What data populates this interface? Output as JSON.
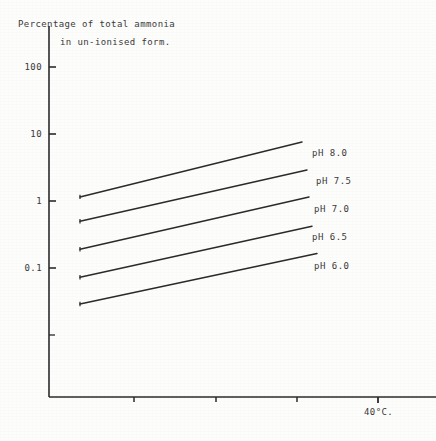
{
  "chart_data": {
    "type": "line",
    "title": "Percentage of total ammonia in un-ionised form.",
    "title_lines": [
      "Percentage of total ammonia",
      "in un-ionised form."
    ],
    "xlabel": "40°C.",
    "ylabel": "",
    "yscale": "log",
    "ytick_labels": [
      "100",
      "10",
      "1",
      "0.1"
    ],
    "ytick_values": [
      100,
      10,
      1,
      0.1
    ],
    "ylim": [
      0.01,
      300
    ],
    "xlim": [
      0,
      45
    ],
    "xtick_labels": [
      "",
      "",
      "",
      "40°C."
    ],
    "xtick_values": [
      10,
      20,
      30,
      40
    ],
    "grid": false,
    "legend_position": "right-inline",
    "series": [
      {
        "name": "pH 8.0",
        "label": "pH 8.0",
        "color": "#2b2b2b",
        "x": [
          10,
          40
        ],
        "values": [
          1.15,
          7.6
        ]
      },
      {
        "name": "pH 7.5",
        "label": "pH 7.5",
        "color": "#2b2b2b",
        "x": [
          10,
          40
        ],
        "values": [
          0.5,
          2.9
        ]
      },
      {
        "name": "pH 7.0",
        "label": "pH 7.0",
        "color": "#2b2b2b",
        "x": [
          10,
          40
        ],
        "values": [
          0.19,
          1.15
        ]
      },
      {
        "name": "pH 6.5",
        "label": "pH 6.5",
        "color": "#2b2b2b",
        "x": [
          10,
          40
        ],
        "values": [
          0.073,
          0.42
        ]
      },
      {
        "name": "pH 6.0",
        "label": "pH 6.0",
        "color": "#2b2b2b",
        "x": [
          10,
          40
        ],
        "values": [
          0.029,
          0.165
        ]
      }
    ]
  },
  "axes": {
    "y_axis_name": "percentage-axis",
    "x_axis_name": "temperature-axis"
  }
}
